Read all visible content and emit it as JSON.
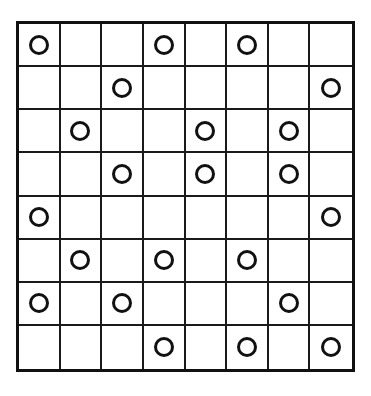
{
  "puzzle": {
    "type": "circle-grid",
    "rows": 8,
    "columns": 8,
    "total_cells": 64,
    "circle_count": 20,
    "colors": {
      "background": "#ffffff",
      "grid_line": "#1a1a1a",
      "frame": "#111111",
      "circle_stroke": "#111111",
      "circle_fill": "transparent"
    },
    "cell_circle_marker": "○",
    "grid": [
      [
        1,
        0,
        0,
        1,
        0,
        1,
        0,
        0
      ],
      [
        0,
        0,
        1,
        0,
        0,
        0,
        0,
        1
      ],
      [
        0,
        1,
        0,
        0,
        1,
        0,
        1,
        0
      ],
      [
        0,
        0,
        1,
        0,
        1,
        0,
        1,
        0
      ],
      [
        1,
        0,
        0,
        0,
        0,
        0,
        0,
        1
      ],
      [
        0,
        1,
        0,
        1,
        0,
        1,
        0,
        0
      ],
      [
        1,
        0,
        1,
        0,
        0,
        0,
        1,
        0
      ],
      [
        0,
        0,
        0,
        1,
        0,
        1,
        0,
        1
      ]
    ],
    "circles_by_row": [
      {
        "row": 1,
        "columns": [
          1,
          4,
          6
        ]
      },
      {
        "row": 2,
        "columns": [
          3,
          8
        ]
      },
      {
        "row": 3,
        "columns": [
          2,
          5,
          7
        ]
      },
      {
        "row": 4,
        "columns": [
          3,
          5,
          7
        ]
      },
      {
        "row": 5,
        "columns": [
          1,
          8
        ]
      },
      {
        "row": 6,
        "columns": [
          2,
          4,
          6
        ]
      },
      {
        "row": 7,
        "columns": [
          1,
          3,
          7
        ]
      },
      {
        "row": 8,
        "columns": [
          4,
          6,
          8
        ]
      }
    ]
  }
}
